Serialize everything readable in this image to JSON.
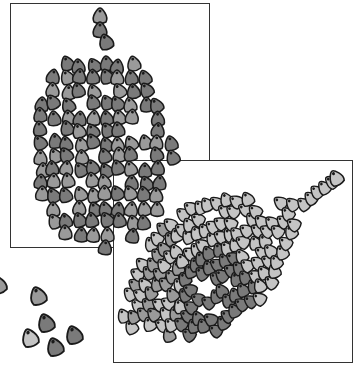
{
  "illustration": {
    "subject": "corn kernels",
    "panels": [
      {
        "name": "ear-top-view",
        "x": 10,
        "y": 3,
        "w": 200,
        "h": 245
      },
      {
        "name": "ear-side-view",
        "x": 113,
        "y": 160,
        "w": 240,
        "h": 203
      }
    ],
    "loose_kernels": 6,
    "colors": {
      "outline": "#1a1a1a",
      "kernel_dark": "#7a7a7a",
      "kernel_mid": "#9a9a9a",
      "kernel_light": "#c4c4c4",
      "frame": "#333333"
    }
  }
}
